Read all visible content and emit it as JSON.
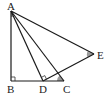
{
  "diagram": {
    "type": "geometry",
    "points": [
      {
        "name": "A",
        "label": "A",
        "x": 11,
        "y": 11
      },
      {
        "name": "B",
        "label": "B",
        "x": 11,
        "y": 81
      },
      {
        "name": "D",
        "label": "D",
        "x": 43,
        "y": 81
      },
      {
        "name": "C",
        "label": "C",
        "x": 64,
        "y": 81
      },
      {
        "name": "E",
        "label": "E",
        "x": 94,
        "y": 54
      }
    ],
    "segments": [
      "AB",
      "BC",
      "AD",
      "AC",
      "AE",
      "DE"
    ],
    "right_angles": [
      "B",
      "D"
    ],
    "shaded_angles": [
      "A",
      "C",
      "E"
    ],
    "colors": {
      "line": "#1a1a1a",
      "shade": "#9a9a9a",
      "background": "#ffffff"
    }
  },
  "labels": {
    "A": "A",
    "B": "B",
    "C": "C",
    "D": "D",
    "E": "E"
  }
}
